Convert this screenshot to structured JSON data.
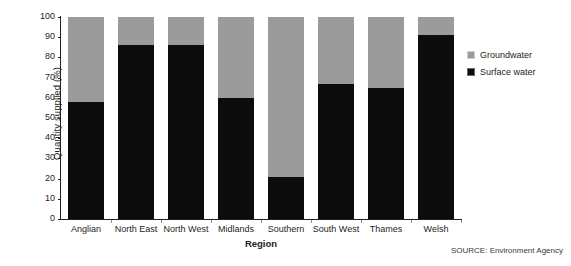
{
  "chart_data": {
    "type": "bar",
    "subtype": "stacked-percentage",
    "title": "",
    "xlabel": "Region",
    "ylabel": "Quantity supplied (%)",
    "ylim": [
      0,
      100
    ],
    "ytick_values": [
      0,
      10,
      20,
      30,
      40,
      50,
      60,
      70,
      80,
      90,
      100
    ],
    "ytick_labels": [
      "0",
      "10",
      "20",
      "30",
      "40",
      "50",
      "60",
      "70",
      "80",
      "90",
      "100"
    ],
    "grid": false,
    "legend_position": "right",
    "categories": [
      "Anglian",
      "North East",
      "North West",
      "Midlands",
      "Southern",
      "South West",
      "Thames",
      "Welsh"
    ],
    "series": [
      {
        "name": "Surface water",
        "color": "#0d0c0c",
        "values": [
          58,
          86,
          86,
          60,
          21,
          67,
          65,
          91
        ]
      },
      {
        "name": "Groundwater",
        "color": "#9b9b9b",
        "values": [
          42,
          14,
          14,
          40,
          79,
          33,
          35,
          9
        ]
      }
    ],
    "annotations": {
      "source": "SOURCE: Environment Agency"
    }
  },
  "legend": {
    "items": [
      {
        "label": "Groundwater",
        "swatch": "groundwater-swatch"
      },
      {
        "label": "Surface water",
        "swatch": "surface-water-swatch"
      }
    ]
  }
}
